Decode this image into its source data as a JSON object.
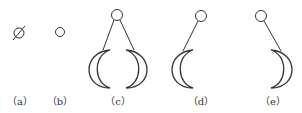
{
  "figure": {
    "stroke_color": "#333333",
    "panels": [
      {
        "id": "a",
        "label": "（a）",
        "description": "circle with diagonal slash",
        "label_x": 20
      },
      {
        "id": "b",
        "label": "（b）",
        "description": "small circle",
        "label_x": 60
      },
      {
        "id": "c",
        "label": "（c）",
        "description": "circle with two lines to two opposing crescents",
        "label_x": 118
      },
      {
        "id": "d",
        "label": "（d）",
        "description": "circle with one line to left crescent",
        "label_x": 201
      },
      {
        "id": "e",
        "label": "（e）",
        "description": "circle with one line to right crescent",
        "label_x": 273
      }
    ]
  }
}
